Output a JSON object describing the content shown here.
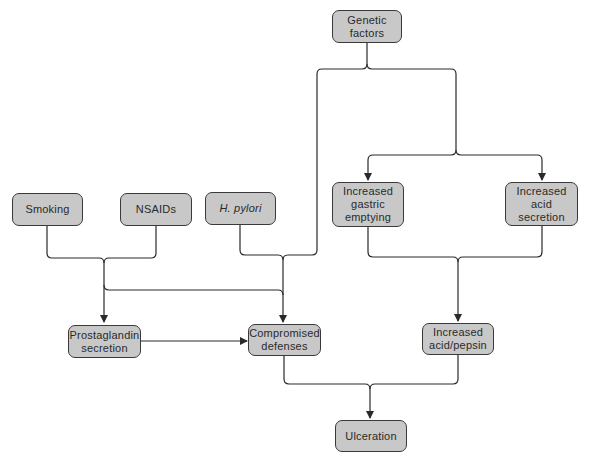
{
  "colors": {
    "node_fill": "#c8c8c8",
    "node_border": "#3a3a3a",
    "line": "#2a2a2a",
    "background": "#ffffff"
  },
  "nodes": {
    "genetic": {
      "label": "Genetic\nfactors"
    },
    "smoking": {
      "label": "Smoking"
    },
    "nsaids": {
      "label": "NSAIDs"
    },
    "hpylori": {
      "label": "H. pylori"
    },
    "gastric": {
      "label": "Increased\ngastric\nemptying"
    },
    "acid_secretion": {
      "label": "Increased acid\nsecretion"
    },
    "prostaglandin": {
      "label": "Prostaglandin\nsecretion"
    },
    "defenses": {
      "label": "Compromised\ndefenses"
    },
    "acid_pepsin": {
      "label": "Increased\nacid/pepsin"
    },
    "ulceration": {
      "label": "Ulceration"
    }
  },
  "edges": [
    {
      "from": "genetic",
      "to": "gastric"
    },
    {
      "from": "genetic",
      "to": "acid_secretion"
    },
    {
      "from": "genetic",
      "to": "defenses"
    },
    {
      "from": "smoking",
      "to": "prostaglandin"
    },
    {
      "from": "nsaids",
      "to": "prostaglandin"
    },
    {
      "from": "smoking",
      "to": "defenses"
    },
    {
      "from": "nsaids",
      "to": "defenses"
    },
    {
      "from": "hpylori",
      "to": "defenses"
    },
    {
      "from": "prostaglandin",
      "to": "defenses"
    },
    {
      "from": "gastric",
      "to": "acid_pepsin"
    },
    {
      "from": "acid_secretion",
      "to": "acid_pepsin"
    },
    {
      "from": "defenses",
      "to": "ulceration"
    },
    {
      "from": "acid_pepsin",
      "to": "ulceration"
    }
  ]
}
